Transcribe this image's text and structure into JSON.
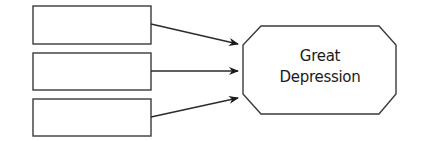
{
  "diagram": {
    "type": "cause-effect",
    "causes": [
      {
        "id": "cause-1",
        "text": ""
      },
      {
        "id": "cause-2",
        "text": ""
      },
      {
        "id": "cause-3",
        "text": ""
      }
    ],
    "effect": {
      "line1": "Great",
      "line2": "Depression"
    },
    "colors": {
      "stroke": "#3a3a3a",
      "fill": "#ffffff",
      "text": "#1a1a1a"
    }
  }
}
